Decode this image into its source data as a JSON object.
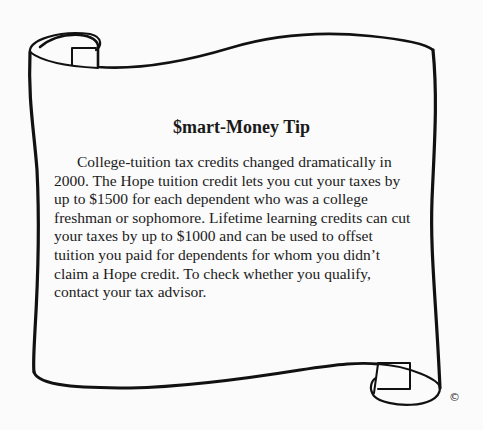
{
  "tip": {
    "title": "$mart-Money Tip",
    "lines": [
      "College-tuition tax credits changed dramatically in",
      "2000. The Hope tuition credit lets you cut your taxes by",
      "up to $1500 for each dependent who was a college",
      "freshman or sophomore. Lifetime learning credits can cut",
      "your taxes by up to $1000 and can be used to offset",
      "tuition you paid for dependents for whom you didn’t",
      "claim a Hope credit. To check whether you qualify,",
      "contact your tax advisor."
    ]
  },
  "decoration": {
    "scroll_icon": "scroll-banner",
    "copyright_symbol": "©"
  }
}
